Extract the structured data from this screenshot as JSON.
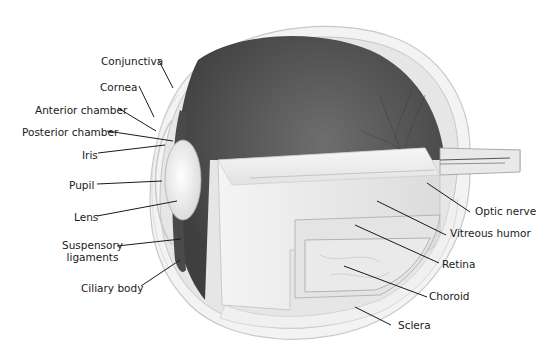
{
  "colors": {
    "background": "#ffffff",
    "label_text": "#1a1a1a",
    "leader_line": "#1a1a1a",
    "interior_dark": "#5a5a5a",
    "sclera": "#f2f2f2",
    "vitreous": "#ededed"
  },
  "labels": {
    "left": [
      {
        "id": "conjunctiva",
        "text": "Conjunctiva"
      },
      {
        "id": "cornea",
        "text": "Cornea"
      },
      {
        "id": "anterior_chamber",
        "text": "Anterior chamber"
      },
      {
        "id": "posterior_chamber",
        "text": "Posterior chamber"
      },
      {
        "id": "iris",
        "text": "Iris"
      },
      {
        "id": "pupil",
        "text": "Pupil"
      },
      {
        "id": "lens",
        "text": "Lens"
      },
      {
        "id": "suspensory_ligaments",
        "text": "Suspensory\nligaments"
      },
      {
        "id": "ciliary_body",
        "text": "Ciliary body"
      }
    ],
    "right": [
      {
        "id": "optic_nerve",
        "text": "Optic nerve"
      },
      {
        "id": "vitreous_humor",
        "text": "Vitreous humor"
      },
      {
        "id": "retina",
        "text": "Retina"
      },
      {
        "id": "choroid",
        "text": "Choroid"
      },
      {
        "id": "sclera",
        "text": "Sclera"
      }
    ]
  }
}
